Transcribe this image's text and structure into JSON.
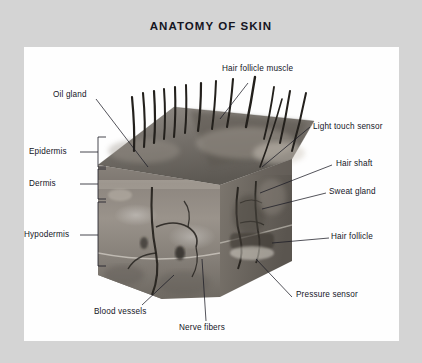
{
  "figure": {
    "title": "ANATOMY OF SKIN",
    "style": "grayscale photographic illustration",
    "frame_color": "#d4d4d4",
    "panel_color": "#fefefe",
    "text_color": "#15151f"
  },
  "labels": {
    "left": [
      {
        "id": "epidermis",
        "text": "Epidermis",
        "x": 29,
        "y": 149
      },
      {
        "id": "dermis",
        "text": "Dermis",
        "x": 29,
        "y": 181
      },
      {
        "id": "hypodermis",
        "text": "Hypodermis",
        "x": 21,
        "y": 232
      }
    ],
    "top": [
      {
        "id": "oil-gland",
        "text": "Oil gland",
        "x": 53,
        "y": 94
      },
      {
        "id": "hair-follicle-muscle",
        "text": "Hair follicle muscle",
        "x": 222,
        "y": 68
      }
    ],
    "right": [
      {
        "id": "light-touch-sensor",
        "text": "Light touch sensor",
        "x": 313,
        "y": 126
      },
      {
        "id": "hair-shaft",
        "text": "Hair shaft",
        "x": 336,
        "y": 163
      },
      {
        "id": "sweat-gland",
        "text": "Sweat gland",
        "x": 329,
        "y": 191
      },
      {
        "id": "hair-follicle",
        "text": "Hair follicle",
        "x": 331,
        "y": 236
      }
    ],
    "bottom": [
      {
        "id": "blood-vessels",
        "text": "Blood vessels",
        "x": 94,
        "y": 311
      },
      {
        "id": "nerve-fibers",
        "text": "Nerve fibers",
        "x": 179,
        "y": 327
      },
      {
        "id": "pressure-sensor",
        "text": "Pressure sensor",
        "x": 296,
        "y": 294
      }
    ]
  },
  "brackets": [
    {
      "id": "epidermis-bracket",
      "top": 137,
      "bottom": 167
    },
    {
      "id": "dermis-bracket",
      "top": 169,
      "bottom": 199
    },
    {
      "id": "hypodermis-bracket",
      "top": 202,
      "bottom": 266
    }
  ]
}
